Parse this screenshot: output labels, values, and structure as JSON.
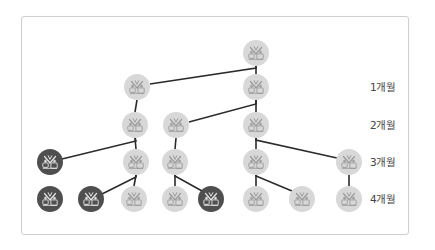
{
  "diagram": {
    "type": "tree",
    "colors": {
      "frame_border": "#cfcfcf",
      "line": "#2b2b2b",
      "node_light": "#d8d8d8",
      "node_dark": "#4f4f4f",
      "icon_on_light": "#9a9a9a",
      "icon_on_dark": "#e6e6e6",
      "label_text": "#444444"
    },
    "node_radius": 13,
    "row_labels": [
      {
        "label": "1개월",
        "y": 87
      },
      {
        "label": "2개월",
        "y": 125
      },
      {
        "label": "3개월",
        "y": 162
      },
      {
        "label": "4개월",
        "y": 199
      }
    ],
    "nodes": [
      {
        "id": "root",
        "x": 256,
        "y": 53,
        "variant": "light",
        "icon": "plant-icon"
      },
      {
        "id": "r1a",
        "x": 137,
        "y": 87,
        "variant": "light",
        "icon": "plant-icon"
      },
      {
        "id": "r1b",
        "x": 256,
        "y": 87,
        "variant": "light",
        "icon": "plant-icon"
      },
      {
        "id": "r2a",
        "x": 135,
        "y": 125,
        "variant": "light",
        "icon": "plant-icon"
      },
      {
        "id": "r2b",
        "x": 176,
        "y": 125,
        "variant": "light",
        "icon": "plant-icon"
      },
      {
        "id": "r2c",
        "x": 256,
        "y": 125,
        "variant": "light",
        "icon": "plant-icon"
      },
      {
        "id": "r3a",
        "x": 50,
        "y": 162,
        "variant": "dark",
        "icon": "plant-icon"
      },
      {
        "id": "r3b",
        "x": 136,
        "y": 162,
        "variant": "light",
        "icon": "plant-icon"
      },
      {
        "id": "r3c",
        "x": 175,
        "y": 162,
        "variant": "light",
        "icon": "plant-icon"
      },
      {
        "id": "r3d",
        "x": 256,
        "y": 162,
        "variant": "light",
        "icon": "plant-icon"
      },
      {
        "id": "r3e",
        "x": 349,
        "y": 162,
        "variant": "light",
        "icon": "plant-icon"
      },
      {
        "id": "r4a",
        "x": 50,
        "y": 199,
        "variant": "dark",
        "icon": "plant-icon"
      },
      {
        "id": "r4b",
        "x": 91,
        "y": 199,
        "variant": "dark",
        "icon": "plant-icon"
      },
      {
        "id": "r4c",
        "x": 134,
        "y": 199,
        "variant": "light",
        "icon": "plant-icon"
      },
      {
        "id": "r4d",
        "x": 175,
        "y": 199,
        "variant": "light",
        "icon": "plant-icon"
      },
      {
        "id": "r4e",
        "x": 211,
        "y": 199,
        "variant": "dark",
        "icon": "plant-icon"
      },
      {
        "id": "r4f",
        "x": 256,
        "y": 199,
        "variant": "light",
        "icon": "plant-icon"
      },
      {
        "id": "r4g",
        "x": 302,
        "y": 199,
        "variant": "light",
        "icon": "plant-icon"
      },
      {
        "id": "r4h",
        "x": 349,
        "y": 199,
        "variant": "light",
        "icon": "plant-icon"
      }
    ],
    "edges": [
      {
        "from": "root",
        "to": "r1b",
        "points": [
          [
            256,
            66
          ],
          [
            256,
            74
          ]
        ]
      },
      {
        "from": "root",
        "to": "r1a",
        "points": [
          [
            256,
            68
          ],
          [
            150,
            84
          ]
        ]
      },
      {
        "from": "r1a",
        "to": "r2a",
        "points": [
          [
            136,
            100
          ],
          [
            136,
            112
          ]
        ]
      },
      {
        "from": "r1b",
        "to": "r2c",
        "points": [
          [
            256,
            100
          ],
          [
            256,
            112
          ]
        ]
      },
      {
        "from": "r1b",
        "to": "r2b",
        "points": [
          [
            256,
            104
          ],
          [
            189,
            122
          ]
        ]
      },
      {
        "from": "r2a",
        "to": "r3b",
        "points": [
          [
            136,
            138
          ],
          [
            136,
            149
          ]
        ]
      },
      {
        "from": "r2a",
        "to": "r3a",
        "points": [
          [
            136,
            141
          ],
          [
            62,
            159
          ]
        ]
      },
      {
        "from": "r2b",
        "to": "r3c",
        "points": [
          [
            175,
            138
          ],
          [
            175,
            149
          ]
        ]
      },
      {
        "from": "r2c",
        "to": "r3d",
        "points": [
          [
            256,
            138
          ],
          [
            256,
            149
          ]
        ]
      },
      {
        "from": "r2c",
        "to": "r3e",
        "points": [
          [
            256,
            140
          ],
          [
            337,
            158
          ]
        ]
      },
      {
        "from": "r3b",
        "to": "r4c",
        "points": [
          [
            136,
            175
          ],
          [
            136,
            186
          ]
        ]
      },
      {
        "from": "r3b",
        "to": "r4b",
        "points": [
          [
            136,
            177
          ],
          [
            102,
            194
          ]
        ]
      },
      {
        "from": "r3c",
        "to": "r4d",
        "points": [
          [
            175,
            175
          ],
          [
            175,
            186
          ]
        ]
      },
      {
        "from": "r3c",
        "to": "r4e",
        "points": [
          [
            175,
            176
          ],
          [
            202,
            191
          ]
        ]
      },
      {
        "from": "r3d",
        "to": "r4f",
        "points": [
          [
            256,
            175
          ],
          [
            256,
            186
          ]
        ]
      },
      {
        "from": "r3d",
        "to": "r4g",
        "points": [
          [
            256,
            176
          ],
          [
            292,
            191
          ]
        ]
      },
      {
        "from": "r3e",
        "to": "r4h",
        "points": [
          [
            349,
            175
          ],
          [
            349,
            186
          ]
        ]
      }
    ]
  }
}
